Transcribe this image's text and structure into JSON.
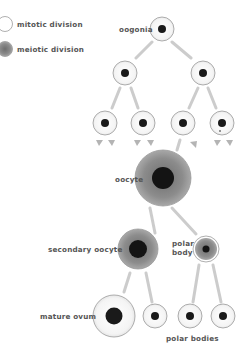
{
  "legend": {
    "mitotic_label": "mitotic division",
    "meiotic_label": "meiotic division"
  },
  "labels": {
    "oogonia": "oogonia",
    "oocyte": "oocyte",
    "secondary_oocyte": "secondary oocyte",
    "polar_body_line1": "polar",
    "polar_body_line2": "body",
    "mature_ovum": "mature ovum",
    "polar_bodies": "polar bodies"
  },
  "colors": {
    "background": "#ffffff",
    "mitotic_fill": "#ffffff",
    "meiotic_fill": "#8a8a8a",
    "nucleus": "#1a1a1a",
    "outline": "#9a9a9a",
    "arrow": "#bdbdbd",
    "text": "#555555"
  },
  "cells": [
    {
      "id": "oogonia",
      "x": 162,
      "y": 29,
      "r": 12,
      "type": "mitotic"
    },
    {
      "id": "l2-left",
      "x": 125,
      "y": 73,
      "r": 12,
      "type": "mitotic"
    },
    {
      "id": "l2-right",
      "x": 203,
      "y": 73,
      "r": 12,
      "type": "mitotic"
    },
    {
      "id": "l3-1",
      "x": 105,
      "y": 123,
      "r": 12,
      "type": "mitotic"
    },
    {
      "id": "l3-2",
      "x": 143,
      "y": 123,
      "r": 12,
      "type": "mitotic"
    },
    {
      "id": "l3-3",
      "x": 183,
      "y": 123,
      "r": 12,
      "type": "mitotic"
    },
    {
      "id": "l3-4",
      "x": 222,
      "y": 123,
      "r": 12,
      "type": "mitotic"
    },
    {
      "id": "oocyte",
      "x": 163,
      "y": 178,
      "r": 28,
      "type": "meiotic"
    },
    {
      "id": "secondary-oocyte",
      "x": 138,
      "y": 249,
      "r": 20,
      "type": "meiotic"
    },
    {
      "id": "polar-body",
      "x": 206,
      "y": 249,
      "r": 13,
      "type": "meiotic"
    },
    {
      "id": "mature-ovum",
      "x": 114,
      "y": 316,
      "r": 21,
      "type": "mitotic"
    },
    {
      "id": "polar-body-1",
      "x": 155,
      "y": 316,
      "r": 12,
      "type": "mitotic"
    },
    {
      "id": "polar-body-2",
      "x": 190,
      "y": 316,
      "r": 12,
      "type": "mitotic"
    },
    {
      "id": "polar-body-3",
      "x": 223,
      "y": 316,
      "r": 12,
      "type": "mitotic"
    }
  ]
}
